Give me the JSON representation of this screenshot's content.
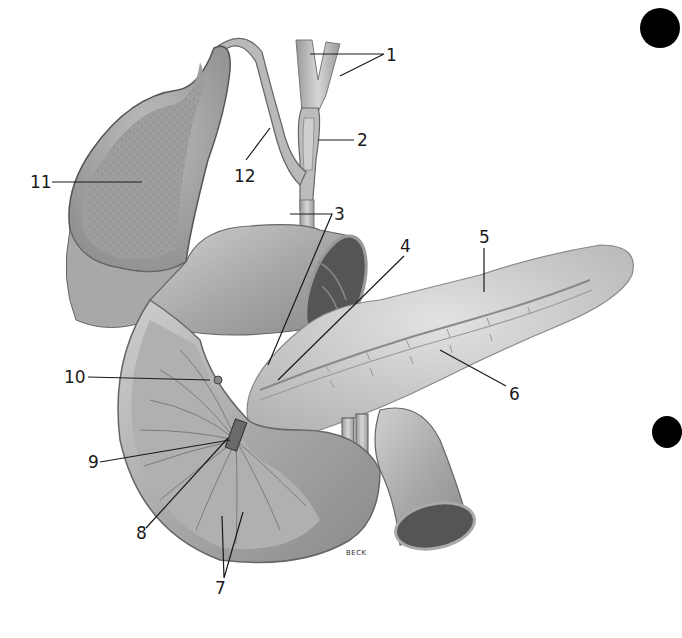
{
  "figure": {
    "signature": "BECK",
    "colors": {
      "background": "#ffffff",
      "tissue_light": "#d9d9d9",
      "tissue_mid": "#b5b5b5",
      "tissue_dark": "#7a7a7a",
      "lumen_dark": "#4a4a4a",
      "leader_line": "#1a1a1a",
      "punch_hole": "#000000"
    }
  },
  "labels": [
    {
      "id": "1",
      "text": "1",
      "x": 386,
      "y": 48,
      "target": "hepatic ducts"
    },
    {
      "id": "2",
      "text": "2",
      "x": 357,
      "y": 133,
      "target": "common hepatic / bile duct"
    },
    {
      "id": "3",
      "text": "3",
      "x": 334,
      "y": 206,
      "target": "common bile duct"
    },
    {
      "id": "4",
      "text": "4",
      "x": 403,
      "y": 240,
      "target": "pancreatic duct (accessory)"
    },
    {
      "id": "5",
      "text": "5",
      "x": 479,
      "y": 230,
      "target": "pancreas"
    },
    {
      "id": "6",
      "text": "6",
      "x": 509,
      "y": 386,
      "target": "pancreatic duct"
    },
    {
      "id": "7",
      "text": "7",
      "x": 215,
      "y": 580,
      "target": "duodenal folds"
    },
    {
      "id": "8",
      "text": "8",
      "x": 137,
      "y": 526,
      "target": "ampulla"
    },
    {
      "id": "9",
      "text": "9",
      "x": 89,
      "y": 455,
      "target": "duodenal papilla"
    },
    {
      "id": "10",
      "text": "10",
      "x": 66,
      "y": 368,
      "target": "minor papilla"
    },
    {
      "id": "11",
      "text": "11",
      "x": 32,
      "y": 174,
      "target": "gallbladder"
    },
    {
      "id": "12",
      "text": "12",
      "x": 236,
      "y": 170,
      "target": "cystic duct"
    }
  ],
  "punch_holes": [
    {
      "x": 660,
      "y": 28,
      "r": 20
    },
    {
      "x": 667,
      "y": 432,
      "r": 16
    }
  ]
}
